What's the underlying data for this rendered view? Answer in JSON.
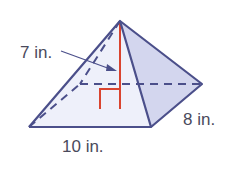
{
  "figure": {
    "type": "rectangular pyramid",
    "labels": {
      "slant_height": "7 in.",
      "base_length": "10 in.",
      "base_width": "8 in."
    },
    "colors": {
      "edge": "#4b4f8a",
      "face_front": "#eef0fa",
      "face_side": "#d3d6ee",
      "height_line": "#d9442f"
    }
  }
}
